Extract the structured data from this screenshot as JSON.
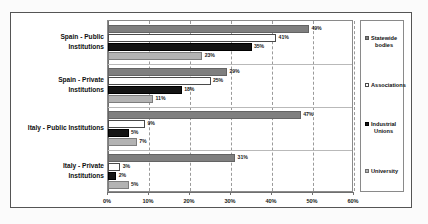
{
  "chart_data": {
    "type": "bar",
    "orientation": "horizontal",
    "title": "",
    "xlabel": "",
    "ylabel": "",
    "xlim": [
      0,
      60
    ],
    "xticks": [
      0,
      10,
      20,
      30,
      40,
      50,
      60
    ],
    "xtick_labels": [
      "0%",
      "10%",
      "20%",
      "30%",
      "40%",
      "50%",
      "60%"
    ],
    "grid": true,
    "legend_position": "right",
    "categories": [
      "Spain - Public Institutions",
      "Spain - Private Institutions",
      "Italy - Public Institutions",
      "Italy - Private Institutions"
    ],
    "series": [
      {
        "name": "Statewide bodies",
        "color": "#7f7f7f",
        "values": [
          49,
          29,
          47,
          31
        ],
        "labels": [
          "49%",
          "29%",
          "47%",
          "31%"
        ]
      },
      {
        "name": "Associations",
        "color": "#ffffff",
        "values": [
          41,
          25,
          9,
          3
        ],
        "labels": [
          "41%",
          "25%",
          "9%",
          "3%"
        ]
      },
      {
        "name": "Industrial Unions",
        "color": "#141414",
        "values": [
          35,
          18,
          5,
          2
        ],
        "labels": [
          "35%",
          "18%",
          "5%",
          "2%"
        ]
      },
      {
        "name": "University",
        "color": "#b3b3b3",
        "values": [
          23,
          11,
          7,
          5
        ],
        "labels": [
          "23%",
          "11%",
          "7%",
          "5%"
        ]
      }
    ]
  },
  "legend": {
    "items": [
      {
        "label_line1": "Statewide",
        "label_line2": "bodies"
      },
      {
        "label_line1": "Associations",
        "label_line2": ""
      },
      {
        "label_line1": "Industrial",
        "label_line2": "Unions"
      },
      {
        "label_line1": "University",
        "label_line2": ""
      }
    ]
  },
  "categories_wrapped": [
    {
      "line1": "Spain - Public",
      "line2": "Institutions"
    },
    {
      "line1": "Spain - Private",
      "line2": "Institutions"
    },
    {
      "line1": "Italy - Public Institutions",
      "line2": ""
    },
    {
      "line1": "Italy - Private",
      "line2": "Institutions"
    }
  ]
}
